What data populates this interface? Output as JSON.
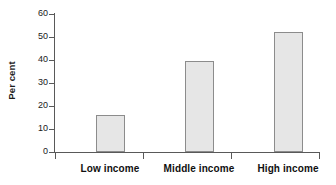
{
  "chart_data": {
    "type": "bar",
    "title": "",
    "xlabel": "",
    "ylabel": "Per cent",
    "categories": [
      "Low income",
      "Middle income",
      "High income"
    ],
    "values": [
      16,
      39.5,
      52
    ],
    "ylim": [
      0,
      60
    ],
    "yticks": [
      0,
      10,
      20,
      30,
      40,
      50,
      60
    ],
    "ytick_labels": [
      "0",
      "10",
      "20",
      "30",
      "40",
      "50",
      "60"
    ],
    "grid": false,
    "legend": null,
    "colors": {
      "bar_fill": "#e6e6e6",
      "bar_border": "#8c8c8c",
      "axis": "#595959",
      "text": "#1a1a1a",
      "background": "#ffffff"
    }
  },
  "axes": {
    "y_title": "Per cent",
    "tick_0": "0",
    "tick_10": "10",
    "tick_20": "20",
    "tick_30": "30",
    "tick_40": "40",
    "tick_50": "50",
    "tick_60": "60"
  },
  "categories": {
    "low": "Low income",
    "middle": "Middle income",
    "high": "High income"
  }
}
